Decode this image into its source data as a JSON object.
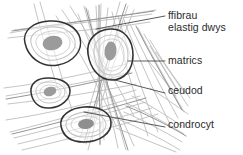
{
  "figure": {
    "background_color": "#ffffff",
    "ink_color": "#2b2b2b",
    "fibre_color": "#b9b9b9",
    "fibre_color_dark": "#8c8c8c",
    "lacuna_outline_color": "#333333",
    "cytoplasm_outline_color": "#c2c2c2",
    "nucleus_color": "#9a9a9a"
  },
  "labels": {
    "fibres": {
      "line1": "ffibrau",
      "line2": "elastig dwys",
      "name": "ffibrau elastig dwys"
    },
    "matrix": {
      "line1": "matrics"
    },
    "lacuna": {
      "line1": "ceudod"
    },
    "chondrocyte": {
      "line1": "condrocyt"
    }
  },
  "structures": [
    {
      "id": "cell-1",
      "label": "condrocyt mewn ceudod",
      "position": "top-left"
    },
    {
      "id": "cell-2",
      "label": "condrocyt mewn ceudod",
      "position": "right-middle"
    },
    {
      "id": "cell-3",
      "label": "condrocyt mewn ceudod",
      "position": "left-lower"
    },
    {
      "id": "cell-4",
      "label": "condrocyt mewn ceudod",
      "position": "bottom-centre"
    }
  ]
}
